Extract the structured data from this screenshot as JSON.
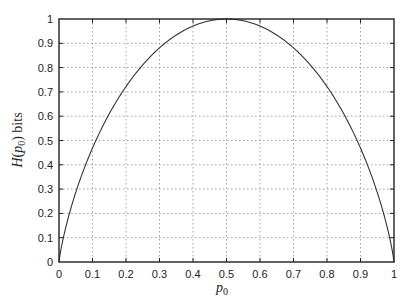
{
  "chart_data": {
    "type": "line",
    "title": "",
    "xlabel": "p0",
    "ylabel": "H(p0) bits",
    "xlim": [
      0,
      1
    ],
    "ylim": [
      0,
      1
    ],
    "grid": true,
    "grid_style": "dotted",
    "legend": null,
    "x_ticks": [
      "0",
      "0.1",
      "0.2",
      "0.3",
      "0.4",
      "0.5",
      "0.6",
      "0.7",
      "0.8",
      "0.9",
      "1"
    ],
    "y_ticks": [
      "0",
      "0.1",
      "0.2",
      "0.3",
      "0.4",
      "0.5",
      "0.6",
      "0.7",
      "0.8",
      "0.9",
      "1"
    ],
    "series": [
      {
        "name": "Binary entropy H(p0)",
        "function": "-p0*log2(p0) - (1-p0)*log2(1-p0)",
        "x": [
          0,
          0.01,
          0.05,
          0.1,
          0.15,
          0.2,
          0.25,
          0.3,
          0.35,
          0.4,
          0.45,
          0.5,
          0.55,
          0.6,
          0.65,
          0.7,
          0.75,
          0.8,
          0.85,
          0.9,
          0.95,
          0.99,
          1
        ],
        "y": [
          0,
          0.081,
          0.286,
          0.469,
          0.61,
          0.722,
          0.811,
          0.881,
          0.934,
          0.971,
          0.993,
          1.0,
          0.993,
          0.971,
          0.934,
          0.881,
          0.811,
          0.722,
          0.61,
          0.469,
          0.286,
          0.081,
          0
        ],
        "color": "#333333"
      }
    ]
  },
  "labels": {
    "x_axis_main": "p",
    "x_axis_sub": "0",
    "y_axis_script": "H",
    "y_axis_open": "(",
    "y_axis_var": "p",
    "y_axis_sub": "0",
    "y_axis_close": ")",
    "y_axis_unit": " bits"
  },
  "colors": {
    "axis": "#222222",
    "grid": "#888888",
    "curve": "#333333"
  }
}
